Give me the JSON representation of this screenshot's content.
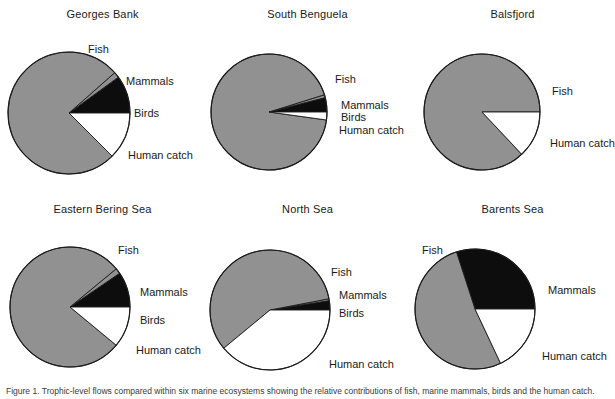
{
  "figure": {
    "background": "#ffffff",
    "caption": "Figure 1. Trophic-level flows compared within six marine ecosystems showing the relative contributions of fish, marine mammals, birds and the human catch.",
    "colors": {
      "fish": "#919191",
      "mammals": "#0d0d0d",
      "birds": "#919191",
      "human_catch": "#ffffff",
      "outline": "#1a1a1a",
      "text": "#1a1a1a"
    },
    "legend_categories": [
      "Fish",
      "Mammals",
      "Birds",
      "Human catch"
    ]
  },
  "chart_data": [
    {
      "type": "pie",
      "title": "Georges Bank",
      "labels": [
        "Fish",
        "Mammals",
        "Birds",
        "Human catch"
      ],
      "values": [
        76.0,
        10.0,
        1.5,
        12.5
      ],
      "colors": [
        "#919191",
        "#0d0d0d",
        "#919191",
        "#ffffff"
      ],
      "start_angle_deg": 0,
      "direction": "clockwise",
      "units": "percent"
    },
    {
      "type": "pie",
      "title": "South Benguela",
      "labels": [
        "Fish",
        "Mammals",
        "Birds",
        "Human catch"
      ],
      "values": [
        93.0,
        4.0,
        0.8,
        2.2
      ],
      "colors": [
        "#919191",
        "#0d0d0d",
        "#919191",
        "#ffffff"
      ],
      "start_angle_deg": 0,
      "direction": "clockwise",
      "units": "percent"
    },
    {
      "type": "pie",
      "title": "Balsfjord",
      "labels": [
        "Fish",
        "Human catch"
      ],
      "values": [
        87.0,
        13.0
      ],
      "colors": [
        "#919191",
        "#ffffff"
      ],
      "start_angle_deg": 0,
      "direction": "clockwise",
      "units": "percent"
    },
    {
      "type": "pie",
      "title": "Eastern Bering Sea",
      "labels": [
        "Fish",
        "Mammals",
        "Birds",
        "Human catch"
      ],
      "values": [
        78.0,
        9.5,
        1.5,
        11.0
      ],
      "colors": [
        "#919191",
        "#0d0d0d",
        "#919191",
        "#ffffff"
      ],
      "start_angle_deg": 0,
      "direction": "clockwise",
      "units": "percent"
    },
    {
      "type": "pie",
      "title": "North Sea",
      "labels": [
        "Fish",
        "Mammals",
        "Birds",
        "Human catch"
      ],
      "values": [
        58.0,
        2.5,
        0.5,
        39.0
      ],
      "colors": [
        "#919191",
        "#0d0d0d",
        "#919191",
        "#ffffff"
      ],
      "start_angle_deg": 0,
      "direction": "clockwise",
      "units": "percent"
    },
    {
      "type": "pie",
      "title": "Barents Sea",
      "labels": [
        "Fish",
        "Mammals",
        "Human catch"
      ],
      "values": [
        52.0,
        30.0,
        18.0
      ],
      "colors": [
        "#919191",
        "#0d0d0d",
        "#ffffff"
      ],
      "start_angle_deg": 0,
      "direction": "clockwise",
      "units": "percent"
    }
  ],
  "panels": [
    {
      "id": "georges-bank",
      "title": "Georges Bank",
      "labels": [
        {
          "text": "Fish",
          "x": 88,
          "y": 36
        },
        {
          "text": "Mammals",
          "x": 126,
          "y": 68
        },
        {
          "text": "Birds",
          "x": 134,
          "y": 100
        },
        {
          "text": "Human catch",
          "x": 128,
          "y": 142
        }
      ]
    },
    {
      "id": "south-benguela",
      "title": "South Benguela",
      "labels": [
        {
          "text": "Fish",
          "x": 130,
          "y": 66
        },
        {
          "text": "Mammals",
          "x": 136,
          "y": 92
        },
        {
          "text": "Birds",
          "x": 136,
          "y": 104
        },
        {
          "text": "Human catch",
          "x": 134,
          "y": 117
        }
      ]
    },
    {
      "id": "balsfjord",
      "title": "Balsfjord",
      "labels": [
        {
          "text": "Fish",
          "x": 142,
          "y": 78
        },
        {
          "text": "Human catch",
          "x": 140,
          "y": 130
        }
      ]
    },
    {
      "id": "eastern-bering-sea",
      "title": "Eastern Bering Sea",
      "labels": [
        {
          "text": "Fish",
          "x": 118,
          "y": 42
        },
        {
          "text": "Mammals",
          "x": 140,
          "y": 84
        },
        {
          "text": "Birds",
          "x": 140,
          "y": 112
        },
        {
          "text": "Human catch",
          "x": 136,
          "y": 142
        }
      ]
    },
    {
      "id": "north-sea",
      "title": "North Sea",
      "labels": [
        {
          "text": "Fish",
          "x": 126,
          "y": 64
        },
        {
          "text": "Mammals",
          "x": 134,
          "y": 87
        },
        {
          "text": "Birds",
          "x": 134,
          "y": 105
        },
        {
          "text": "Human catch",
          "x": 124,
          "y": 156
        }
      ]
    },
    {
      "id": "barents-sea",
      "title": "Barents Sea",
      "labels": [
        {
          "text": "Fish",
          "x": 12,
          "y": 42
        },
        {
          "text": "Mammals",
          "x": 138,
          "y": 82
        },
        {
          "text": "Human catch",
          "x": 132,
          "y": 148
        }
      ]
    }
  ]
}
